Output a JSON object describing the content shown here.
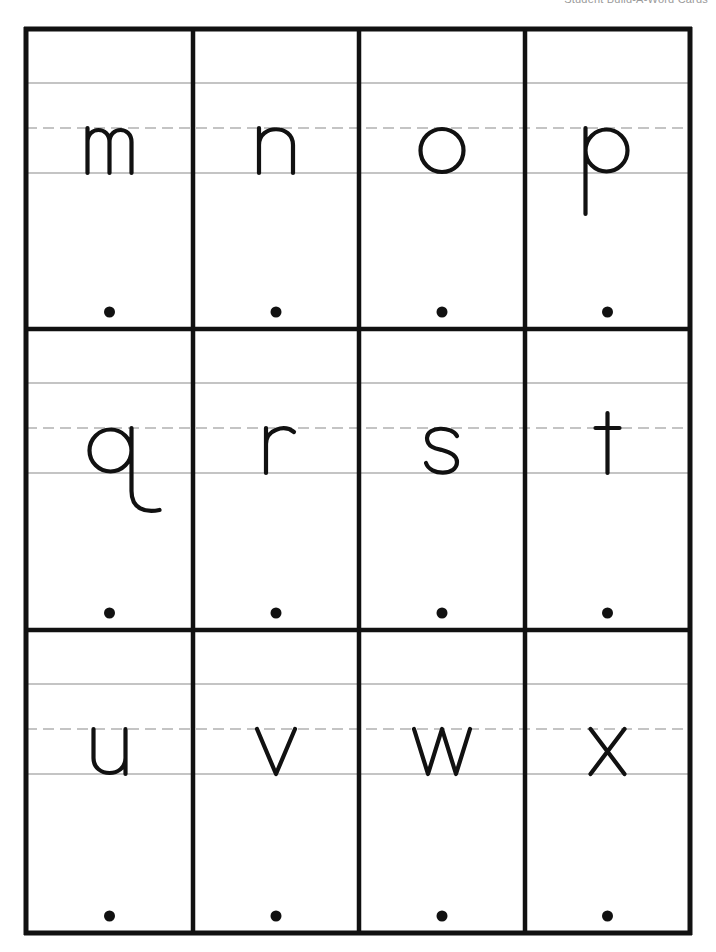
{
  "header": {
    "title": "Student Build-A-Word Cards"
  },
  "grid": {
    "rows": 3,
    "columns": 4
  },
  "cards": [
    {
      "letter": "m"
    },
    {
      "letter": "n"
    },
    {
      "letter": "o"
    },
    {
      "letter": "p"
    },
    {
      "letter": "q"
    },
    {
      "letter": "r"
    },
    {
      "letter": "s"
    },
    {
      "letter": "t"
    },
    {
      "letter": "u"
    },
    {
      "letter": "v"
    },
    {
      "letter": "w"
    },
    {
      "letter": "x"
    }
  ],
  "colors": {
    "border": "#111111",
    "guide_line": "#c4c4c4",
    "ink": "#111111"
  }
}
